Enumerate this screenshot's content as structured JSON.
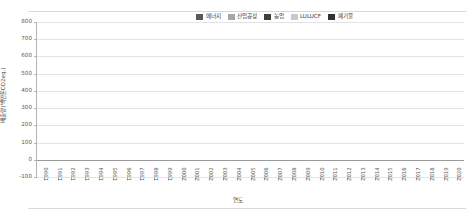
{
  "chart_data": {
    "type": "bar",
    "stacked": true,
    "title": "",
    "xlabel": "연도",
    "ylabel": "배출량(백만톤CO2eq.)",
    "ylim": [
      -100,
      800
    ],
    "yticks": [
      800,
      700,
      600,
      500,
      400,
      300,
      200,
      100,
      0,
      -100
    ],
    "ytick_labels": [
      "800",
      "700",
      "600",
      "500",
      "400",
      "300",
      "200",
      "100",
      "0",
      "-100"
    ],
    "grid": true,
    "legend_position": "top-right",
    "categories": [
      "1990",
      "1991",
      "1992",
      "1993",
      "1994",
      "1995",
      "1996",
      "1997",
      "1998",
      "1999",
      "2000",
      "2001",
      "2002",
      "2003",
      "2004",
      "2005",
      "2006",
      "2007",
      "2008",
      "2009",
      "2010",
      "2011",
      "2012",
      "2013",
      "2014",
      "2015",
      "2016",
      "2017",
      "2018",
      "2019",
      "2020"
    ],
    "series": [
      {
        "name": "에너지",
        "color": "#595959",
        "values": [
          240,
          262,
          285,
          311,
          329,
          357,
          389,
          408,
          347,
          384,
          417,
          437,
          449,
          459,
          472,
          473,
          482,
          505,
          514,
          518,
          566,
          589,
          589,
          601,
          593,
          600,
          607,
          623,
          632,
          611,
          569
        ]
      },
      {
        "name": "산업공정",
        "color": "#a6a6a6",
        "values": [
          20,
          22,
          24,
          27,
          29,
          32,
          35,
          37,
          33,
          36,
          45,
          47,
          49,
          50,
          52,
          53,
          54,
          56,
          57,
          54,
          57,
          59,
          60,
          61,
          60,
          61,
          62,
          63,
          64,
          61,
          55
        ]
      },
      {
        "name": "농업",
        "color": "#404040",
        "values": [
          19,
          19,
          20,
          20,
          21,
          21,
          21,
          21,
          21,
          21,
          21,
          21,
          21,
          21,
          21,
          21,
          21,
          21,
          21,
          21,
          21,
          21,
          21,
          21,
          21,
          21,
          21,
          21,
          21,
          21,
          21
        ]
      },
      {
        "name": "LULUCF",
        "color": "#c9c9c9",
        "values": [
          -30,
          -31,
          -32,
          -33,
          -35,
          -36,
          -38,
          -39,
          -40,
          -41,
          -42,
          -43,
          -44,
          -45,
          -46,
          -46,
          -47,
          -47,
          -48,
          -48,
          -49,
          -49,
          -48,
          -47,
          -46,
          -45,
          -45,
          -44,
          -43,
          -42,
          -41
        ]
      },
      {
        "name": "폐기물",
        "color": "#333333",
        "values": [
          13,
          14,
          14,
          15,
          15,
          16,
          17,
          17,
          17,
          17,
          17,
          17,
          17,
          17,
          17,
          17,
          17,
          17,
          17,
          17,
          17,
          17,
          17,
          17,
          17,
          17,
          17,
          17,
          17,
          17,
          17
        ]
      }
    ],
    "totals_above_zero": [
      292,
      317,
      343,
      373,
      394,
      426,
      462,
      483,
      418,
      458,
      500,
      522,
      536,
      547,
      562,
      564,
      574,
      599,
      609,
      610,
      661,
      686,
      687,
      700,
      691,
      699,
      707,
      724,
      734,
      710,
      662
    ]
  },
  "legend": {
    "items": [
      {
        "label": "에너지",
        "color": "#595959"
      },
      {
        "label": "산업공정",
        "color": "#a6a6a6"
      },
      {
        "label": "농업",
        "color": "#404040"
      },
      {
        "label": "LULUCF",
        "color": "#c9c9c9"
      },
      {
        "label": "폐기물",
        "color": "#333333"
      }
    ]
  }
}
